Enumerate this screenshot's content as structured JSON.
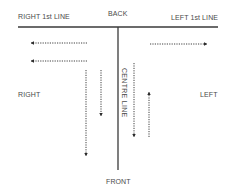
{
  "diagram": {
    "labels": {
      "back": "BACK",
      "front": "FRONT",
      "right_first_line": "RIGHT 1st LINE",
      "left_first_line": "LEFT 1st LINE",
      "right": "RIGHT",
      "left": "LEFT",
      "centre_line": "CENTRE LINE"
    },
    "lines": {
      "back_line": {
        "x1": 18,
        "y1": 27,
        "x2": 218,
        "y2": 27
      },
      "centre_line": {
        "x1": 118,
        "y1": 27,
        "x2": 118,
        "y2": 170
      }
    },
    "arrows": [
      {
        "id": "right-arrow-top",
        "direction": "left",
        "x1": 87,
        "y1": 43,
        "x2": 30,
        "y2": 43
      },
      {
        "id": "right-arrow-bottom",
        "direction": "left",
        "x1": 87,
        "y1": 61,
        "x2": 30,
        "y2": 61
      },
      {
        "id": "right-down-long",
        "direction": "down",
        "x1": 86,
        "y1": 70,
        "x2": 86,
        "y2": 156
      },
      {
        "id": "right-down-short",
        "direction": "down",
        "x1": 101,
        "y1": 70,
        "x2": 101,
        "y2": 116
      },
      {
        "id": "left-arrow-top",
        "direction": "right",
        "x1": 150,
        "y1": 44,
        "x2": 208,
        "y2": 44
      },
      {
        "id": "centre-down",
        "direction": "down",
        "x1": 134,
        "y1": 63,
        "x2": 134,
        "y2": 137
      },
      {
        "id": "left-up",
        "direction": "up",
        "x1": 149,
        "y1": 137,
        "x2": 149,
        "y2": 91
      }
    ],
    "colors": {
      "line": "#3a3a3a",
      "arrow": "#2a2a2a",
      "text": "#4a4a4a"
    }
  }
}
